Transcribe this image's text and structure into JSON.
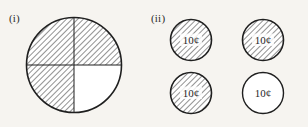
{
  "figure": {
    "background_color": "#f6f4f0",
    "ink_color": "#1f1f1f",
    "hatch_color": "#6d6d6d",
    "parts": [
      {
        "label": "(i)",
        "name": "part-i-circle-quarters",
        "shape": "circle",
        "description": "circle divided into four quarters",
        "center_x": 74,
        "center_y": 65,
        "radius": 48,
        "total_parts": 4,
        "shaded_parts": 3,
        "fraction_shaded": "3/4",
        "quadrants": [
          {
            "name": "top-left",
            "shaded": true
          },
          {
            "name": "top-right",
            "shaded": true
          },
          {
            "name": "bottom-left",
            "shaded": true
          },
          {
            "name": "bottom-right",
            "shaded": false
          }
        ]
      },
      {
        "label": "(ii)",
        "name": "part-ii-coin-group",
        "shape": "coins",
        "description": "four ten-cent coins, three shaded",
        "coin_radius": 21,
        "total_coins": 4,
        "shaded_coins": 3,
        "fraction_shaded": "3/4",
        "coins": [
          {
            "name": "coin-top-left",
            "value_label": "10¢",
            "shaded": true,
            "cx": 191,
            "cy": 40
          },
          {
            "name": "coin-top-right",
            "value_label": "10¢",
            "shaded": true,
            "cx": 263,
            "cy": 40
          },
          {
            "name": "coin-bottom-left",
            "value_label": "10¢",
            "shaded": true,
            "cx": 191,
            "cy": 93
          },
          {
            "name": "coin-bottom-right",
            "value_label": "10¢",
            "shaded": false,
            "cx": 263,
            "cy": 93
          }
        ]
      }
    ]
  }
}
